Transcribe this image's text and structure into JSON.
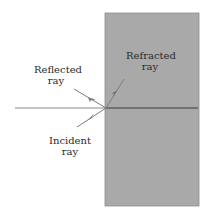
{
  "diagram": {
    "type": "refraction-at-interface",
    "colors": {
      "background": "#ffffff",
      "medium": "#a9a9a9",
      "medium_edge": "#7a7a7a",
      "ray": "#7c7c7c",
      "normal_outside": "#8a8a8a",
      "normal_inside": "#3a3a3a",
      "text": "#2a2a2a"
    },
    "geometry": {
      "medium_rect": {
        "x": 105,
        "y": 13,
        "width": 94,
        "height": 193
      },
      "normal_line": {
        "x1": 15,
        "y1": 108,
        "x2": 198,
        "y2": 108
      },
      "interface_point": {
        "x": 106,
        "y": 108
      },
      "incident_ray": {
        "x1": 77,
        "y1": 127,
        "x2": 106,
        "y2": 108
      },
      "reflected_ray": {
        "x1": 74,
        "y1": 89,
        "x2": 106,
        "y2": 108
      },
      "refracted_ray": {
        "x1": 106,
        "y1": 108,
        "x2": 124,
        "y2": 79
      }
    },
    "labels": {
      "reflected": {
        "line1": "Reflected",
        "line2": "ray"
      },
      "incident": {
        "line1": "Incident",
        "line2": "ray"
      },
      "refracted": {
        "line1": "Refracted",
        "line2": "ray"
      }
    }
  }
}
